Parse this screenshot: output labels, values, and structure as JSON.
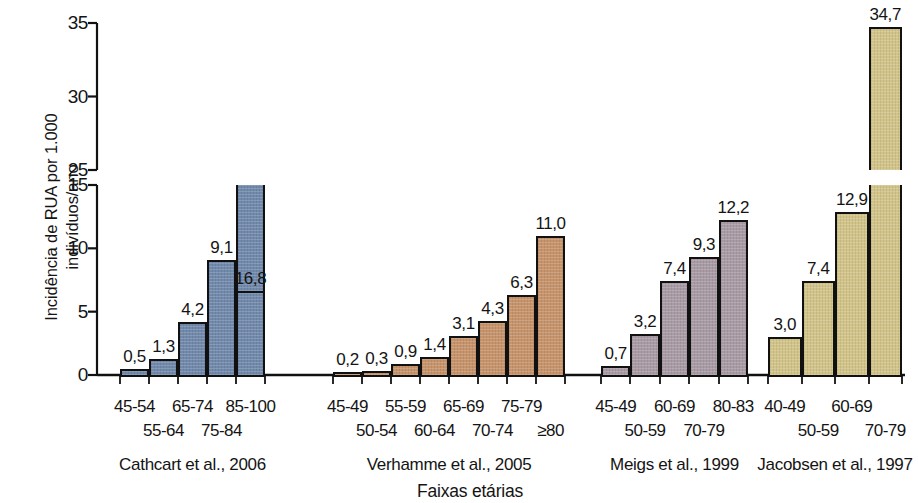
{
  "chart_data": {
    "type": "bar",
    "title": "",
    "xlabel": "Faixas etárias",
    "ylabel": "Incidência de RUA por 1.000\nindivíduos/ano",
    "ylim": [
      0,
      35
    ],
    "y_axis_broken": true,
    "y_axis_segments": [
      {
        "from": 0,
        "to": 15,
        "ticks": [
          0,
          5,
          10,
          15
        ]
      },
      {
        "from": 25,
        "to": 35,
        "ticks": [
          25,
          30,
          35
        ]
      }
    ],
    "ytick_labels": [
      "35",
      "30",
      "25",
      "15",
      "10",
      "5",
      "0"
    ],
    "grid": false,
    "legend": "none",
    "value_decimal_separator": ",",
    "groups": [
      {
        "name": "Cathcart et al., 2006",
        "color": "#7189ab",
        "categories": [
          "45-54",
          "55-64",
          "65-74",
          "75-84",
          "85-100"
        ],
        "values": [
          0.5,
          1.3,
          4.2,
          9.1,
          16.8
        ],
        "value_labels": [
          "0,5",
          "1,3",
          "4,2",
          "9,1",
          "16,8"
        ]
      },
      {
        "name": "Verhamme et al., 2005",
        "color": "#c6936b",
        "categories": [
          "45-49",
          "50-54",
          "55-59",
          "60-64",
          "65-69",
          "70-74",
          "75-79",
          "≥80"
        ],
        "values": [
          0.2,
          0.3,
          0.9,
          1.4,
          3.1,
          4.3,
          6.3,
          11.0
        ],
        "value_labels": [
          "0,2",
          "0,3",
          "0,9",
          "1,4",
          "3,1",
          "4,3",
          "6,3",
          "11,0"
        ]
      },
      {
        "name": "Meigs et al., 1999",
        "color": "#a99ba5",
        "categories": [
          "45-49",
          "50-59",
          "60-69",
          "70-79",
          "80-83"
        ],
        "values": [
          0.7,
          3.2,
          7.4,
          9.3,
          12.2
        ],
        "value_labels": [
          "0,7",
          "3,2",
          "7,4",
          "9,3",
          "12,2"
        ]
      },
      {
        "name": "Jacobsen et al., 1997",
        "color": "#d2c488",
        "categories": [
          "40-49",
          "50-59",
          "60-69",
          "70-79"
        ],
        "values": [
          3.0,
          7.4,
          12.9,
          34.7
        ],
        "value_labels": [
          "3,0",
          "7,4",
          "12,9",
          "34,7"
        ]
      }
    ]
  }
}
